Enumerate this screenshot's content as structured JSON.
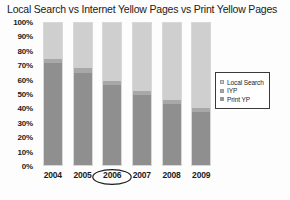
{
  "chart_data": {
    "type": "bar",
    "title": "Local Search vs Internet Yellow Pages vs Print Yellow Pages",
    "xlabel": "",
    "ylabel": "",
    "ylim": [
      0,
      100
    ],
    "grid": false,
    "stacked": true,
    "legend_position": "right",
    "categories": [
      "2004",
      "2005",
      "2006",
      "2007",
      "2008",
      "2009"
    ],
    "highlighted_category": "2006",
    "ytick_labels": [
      "100%",
      "90%",
      "80%",
      "70%",
      "60%",
      "50%",
      "40%",
      "30%",
      "20%",
      "10%",
      "0%"
    ],
    "ytick_values": [
      100,
      90,
      80,
      70,
      60,
      50,
      40,
      30,
      20,
      10,
      0
    ],
    "series": [
      {
        "name": "Local Search",
        "color": "#cfcfcf",
        "values": [
          25,
          32,
          41,
          48,
          54,
          60
        ]
      },
      {
        "name": "IYP",
        "color": "#a8a8a8",
        "values": [
          3,
          3,
          3,
          3,
          3,
          3
        ]
      },
      {
        "name": "Print YP",
        "color": "#8f8f8f",
        "values": [
          72,
          65,
          56,
          49,
          43,
          37
        ]
      }
    ]
  },
  "legend": {
    "entries": [
      {
        "label": "Local Search"
      },
      {
        "label": "IYP"
      },
      {
        "label": "Print YP"
      }
    ]
  }
}
